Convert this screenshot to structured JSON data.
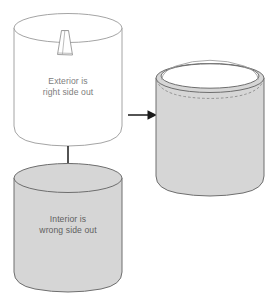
{
  "diagram": {
    "palette": {
      "background": "#ffffff",
      "fabric_gray": "#d6d6d6",
      "fabric_gray_dark": "#cfcfcf",
      "outline_light": "#9a9a9a",
      "outline_dark": "#6e6e6e",
      "text_light": "#8a8a8a",
      "text_dark": "#5f5f5f",
      "arrow": "#1a1a1a",
      "white": "#ffffff"
    },
    "steps": [
      {
        "id": "exterior-cylinder",
        "name": "exterior-cylinder",
        "fill": "white",
        "caption_line1": "Exterior is",
        "caption_line2": "right side out",
        "detail": "hanging-tag"
      },
      {
        "id": "interior-cylinder",
        "name": "interior-cylinder",
        "fill": "gray",
        "caption_line1": "Interior is",
        "caption_line2": "wrong side out",
        "detail": "closed-top"
      },
      {
        "id": "assembled-cylinder",
        "name": "assembled-cylinder",
        "fill": "gray",
        "caption_line1": "",
        "caption_line2": "",
        "detail": "open-mouth-with-rim"
      }
    ],
    "arrows": [
      {
        "id": "down-arrow",
        "name": "down-arrow",
        "direction": "down",
        "glyph": "arrow-down-icon"
      },
      {
        "id": "right-arrow",
        "name": "right-arrow",
        "direction": "right",
        "glyph": "arrow-right-icon"
      }
    ],
    "labels": {
      "exterior_line1": "Exterior is",
      "exterior_line2": "right side out",
      "interior_line1": "Interior is",
      "interior_line2": "wrong side out"
    }
  }
}
